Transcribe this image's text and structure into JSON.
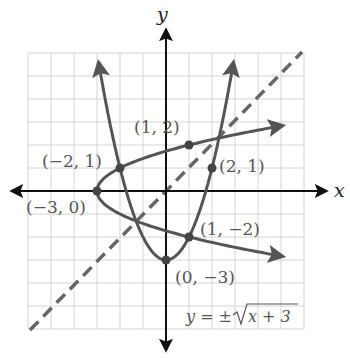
{
  "chart_data": {
    "type": "line",
    "title": "",
    "xlabel": "x",
    "ylabel": "y",
    "xlim": [
      -6,
      6
    ],
    "ylim": [
      -6,
      6
    ],
    "grid": true,
    "grid_step": 1,
    "legend": null,
    "series": [
      {
        "name": "y = x^2 - 3",
        "style": "solid",
        "color": "#555555",
        "x": [
          -3,
          -2.5,
          -2,
          -1,
          0,
          1,
          2,
          2.5,
          3
        ],
        "y": [
          6,
          3.25,
          1,
          -2,
          -3,
          -2,
          1,
          3.25,
          6
        ]
      },
      {
        "name": "y = ±√(x + 3)",
        "style": "solid",
        "color": "#555555",
        "x": [
          -3,
          -2,
          1,
          6
        ],
        "y_upper": [
          0,
          1,
          2,
          3
        ],
        "y_lower": [
          0,
          -1,
          -2,
          -3
        ]
      },
      {
        "name": "y = x",
        "style": "dashed",
        "color": "#666666",
        "x": [
          -6,
          6
        ],
        "y": [
          -6,
          6
        ]
      }
    ],
    "points": [
      {
        "x": -3,
        "y": 0,
        "label": "(−3, 0)"
      },
      {
        "x": -2,
        "y": 1,
        "label": "(−2, 1)"
      },
      {
        "x": 1,
        "y": 2,
        "label": "(1, 2)"
      },
      {
        "x": 2,
        "y": 1,
        "label": "(2, 1)"
      },
      {
        "x": 1,
        "y": -2,
        "label": "(1, −2)"
      },
      {
        "x": 0,
        "y": -3,
        "label": "(0, −3)"
      }
    ],
    "annotations": [
      {
        "text": "y = ±√x + 3",
        "position": "bottom-right"
      }
    ]
  },
  "labels": {
    "x_axis": "x",
    "y_axis": "y",
    "pt_m3_0": "(−3, 0)",
    "pt_m2_1": "(−2, 1)",
    "pt_1_2": "(1, 2)",
    "pt_2_1": "(2, 1)",
    "pt_1_m2": "(1, −2)",
    "pt_0_m3": "(0, −3)",
    "equation_lhs": "y = ±",
    "equation_rad": "x + 3"
  },
  "colors": {
    "grid": "#d4d4d4",
    "axis": "#111111",
    "curve": "#555555",
    "dashed": "#666666",
    "text": "#555555"
  }
}
